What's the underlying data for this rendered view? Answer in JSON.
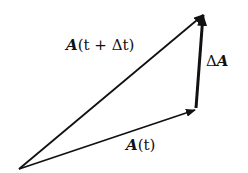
{
  "diagram": {
    "type": "vector-addition",
    "labels": {
      "a_t": {
        "symbol": "A",
        "arg": "(t)"
      },
      "a_t_dt": {
        "symbol": "A",
        "arg": "(t + Δt)"
      },
      "delta_a": {
        "prefix": "Δ",
        "symbol": "A"
      }
    },
    "colors": {
      "stroke": "#111111",
      "background": "#ffffff"
    }
  }
}
